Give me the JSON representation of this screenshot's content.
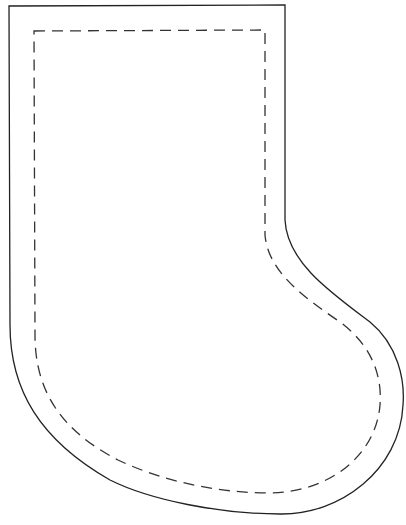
{
  "diagram": {
    "type": "sewing-pattern",
    "outline": {
      "style": "solid",
      "label": "cut line",
      "color": "#222222"
    },
    "seam": {
      "style": "dashed",
      "label": "stitch line",
      "color": "#333333"
    }
  },
  "caption": ""
}
